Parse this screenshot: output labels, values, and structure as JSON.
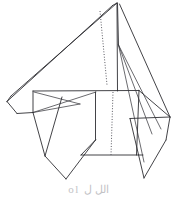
{
  "figure": {
    "kind": "line-drawing",
    "background_color": "#ffffff",
    "stroke_color": "#2e2e32",
    "dotted_stroke_color": "#5a5a62",
    "width": 177,
    "height": 199,
    "caption_partial": "ol الل ل",
    "caption_color": "#c3c3c6",
    "strokes": {
      "upper_left_wing_top": "M 117,3 L 11,96",
      "upper_left_wing_bottom": "M 112,5 L 7,101",
      "left_tip_close": "M 11,96 L 7,101",
      "left_tip_lower_edge": "M 7,101 L 30,112",
      "left_inner_fold_a": "M 30,112 L 33,91",
      "left_inner_fold_b": "M 33,91 L 30,112",
      "left_inner_diag_1": "M 30,112 L 96,92",
      "left_inner_diag_2": "M 33,91 L 78,105",
      "left_inner_diag_3": "M 30,112 L 62,97",
      "mid_horizontal": "M 33,91 L 139,91",
      "center_spine_top": "M 117,3 L 117,91",
      "apex_right_edge_outer": "M 120,4 L 170,117",
      "apex_right_edge_inner": "M 117,3 L 118,44",
      "right_fan_1": "M 118,44 L 160,129",
      "right_fan_2": "M 118,44 L 150,133",
      "right_fan_3": "M 118,44 L 143,160",
      "right_panel_top": "M 139,91 L 170,117",
      "right_panel_edge": "M 130,118 L 170,117",
      "right_panel_lower": "M 130,118 L 143,178",
      "right_tip_v_left": "M 143,160 L 143,178",
      "right_tip_v_right": "M 143,178 L 166,140",
      "right_outer_down": "M 170,117 L 166,140",
      "body_left_edge": "M 95,92 L 95,140",
      "body_left_fold": "M 95,140 L 81,155",
      "body_bottom": "M 81,155 L 143,155",
      "body_right_edge_upper": "M 139,91 L 136,155",
      "center_dotted_upper": "M 101,10 L 107,84",
      "center_dotted_main": "M 113,92 L 111,155",
      "lower_flap_left": "M 33,112 L 45,155",
      "lower_flap_tip": "M 45,155 L 66,178",
      "lower_flap_right": "M 66,178 L 95,140",
      "lower_flap_inner": "M 62,97 L 45,155"
    }
  }
}
